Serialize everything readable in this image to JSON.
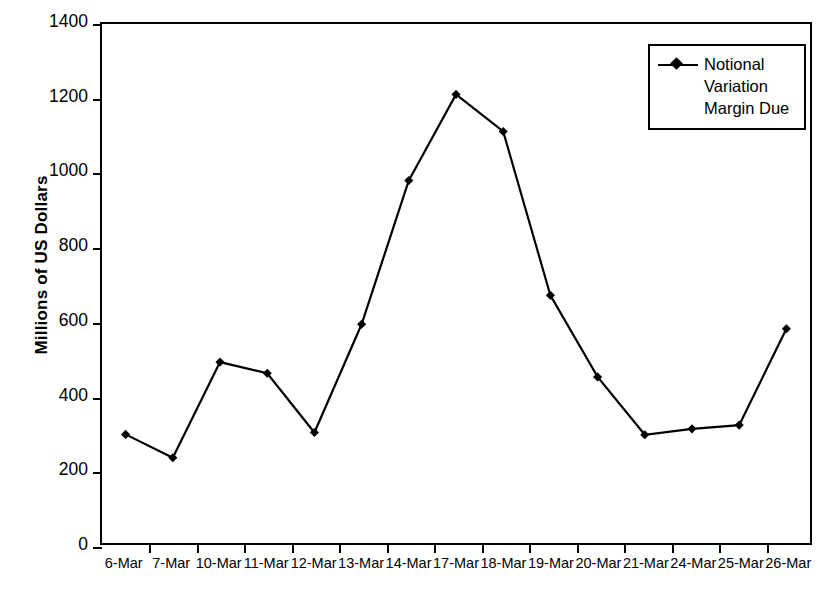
{
  "chart_data": {
    "type": "line",
    "title": "",
    "xlabel": "",
    "ylabel": "Millions of US Dollars",
    "categories": [
      "6-Mar",
      "7-Mar",
      "10-Mar",
      "11-Mar",
      "12-Mar",
      "13-Mar",
      "14-Mar",
      "17-Mar",
      "18-Mar",
      "19-Mar",
      "20-Mar",
      "21-Mar",
      "24-Mar",
      "25-Mar",
      "26-Mar"
    ],
    "series": [
      {
        "name": "Notional Variation Margin Due",
        "values": [
          293,
          230,
          488,
          458,
          298,
          590,
          978,
          1210,
          1110,
          668,
          448,
          292,
          308,
          318,
          578
        ]
      }
    ],
    "ylim": [
      0,
      1400
    ],
    "yticks": [
      0,
      200,
      400,
      600,
      800,
      1000,
      1200,
      1400
    ],
    "ytick_labels": [
      "0",
      "200",
      "400",
      "600",
      "800",
      "1000",
      "1200",
      "1400"
    ],
    "grid": false,
    "legend_position": "top-right",
    "marker": "diamond",
    "line_color": "#000000",
    "marker_color": "#000000",
    "background_color": "#ffffff"
  },
  "legend": {
    "entries": [
      {
        "label": "Notional\nVariation\nMargin Due",
        "marker": "line-diamond-marker"
      }
    ]
  },
  "axes": {
    "y_title": "Millions of US Dollars"
  }
}
